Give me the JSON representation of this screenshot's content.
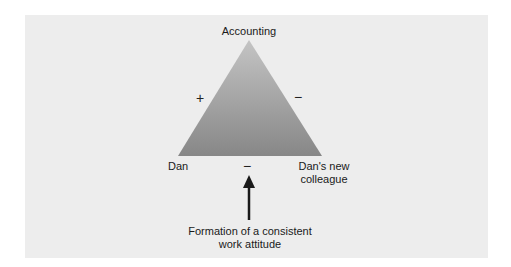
{
  "diagram": {
    "type": "balance-triangle",
    "nodes": {
      "top": "Accounting",
      "left": "Dan",
      "right_line1": "Dan's new",
      "right_line2": "colleague"
    },
    "relations": {
      "left_edge": "+",
      "right_edge": "−",
      "base_edge": "−"
    },
    "caption_line1": "Formation of a consistent",
    "caption_line2": "work attitude",
    "colors": {
      "panel": "#ededed",
      "triangle_top": "#bdbdbd",
      "triangle_bottom": "#8a8a8a",
      "arrow": "#1a1a1a"
    }
  }
}
